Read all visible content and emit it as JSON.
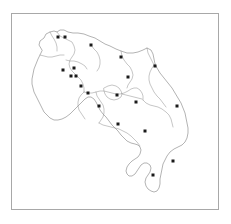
{
  "figure": {
    "type": "point-location-map",
    "title": "",
    "region_name": "Costa Rica",
    "background_color": "#ffffff",
    "frame_color": "#a8a8a8",
    "outline_color": "#808080",
    "border_color": "#8d8d8d",
    "marker_color": "#1a1a1a",
    "marker_count": 20,
    "marker_shape": "square",
    "marker_size_px": 3,
    "legend": null,
    "axis_labels": null,
    "scale_bar": null,
    "north_arrow": null
  },
  "chart_data": {
    "type": "scatter",
    "title": "",
    "xlabel": "",
    "ylabel": "",
    "xlim": [
      11,
      219
    ],
    "ylim": [
      13,
      210
    ],
    "grid": false,
    "legend": null,
    "categories": [],
    "series": [
      {
        "name": "sampling-sites",
        "marker": "square",
        "color": "#1a1a1a",
        "points": [
          {
            "id": "site-01",
            "x": 58,
            "y": 37
          },
          {
            "id": "site-02",
            "x": 65,
            "y": 37
          },
          {
            "id": "site-03",
            "x": 91,
            "y": 45
          },
          {
            "id": "site-04",
            "x": 121,
            "y": 57
          },
          {
            "id": "site-05",
            "x": 155,
            "y": 66
          },
          {
            "id": "site-06",
            "x": 63,
            "y": 70
          },
          {
            "id": "site-07",
            "x": 74,
            "y": 68
          },
          {
            "id": "site-08",
            "x": 71,
            "y": 76
          },
          {
            "id": "site-09",
            "x": 76,
            "y": 76
          },
          {
            "id": "site-10",
            "x": 128,
            "y": 77
          },
          {
            "id": "site-11",
            "x": 81,
            "y": 86
          },
          {
            "id": "site-12",
            "x": 88,
            "y": 93
          },
          {
            "id": "site-13",
            "x": 117,
            "y": 95
          },
          {
            "id": "site-14",
            "x": 136,
            "y": 102
          },
          {
            "id": "site-15",
            "x": 99,
            "y": 106
          },
          {
            "id": "site-16",
            "x": 177,
            "y": 106
          },
          {
            "id": "site-17",
            "x": 118,
            "y": 124
          },
          {
            "id": "site-18",
            "x": 145,
            "y": 131
          },
          {
            "id": "site-19",
            "x": 173,
            "y": 161
          },
          {
            "id": "site-20",
            "x": 153,
            "y": 175
          }
        ]
      }
    ]
  },
  "geometry": {
    "country_outline_path": "M 42 50 L 39 45 L 40 41 L 44 38 L 46 34 L 50 32 L 54 31 L 57 32 L 60 30 L 64 30 L 68 32 L 73 33 L 78 33 L 84 34 L 89 36 L 95 38 L 100 41 L 105 44 L 110 46 L 116 49 L 121 51 L 127 53 L 133 53 L 138 52 L 143 50 L 147 48 L 151 50 L 153 54 L 154 59 L 155 64 L 157 68 L 160 73 L 164 78 L 168 83 L 172 88 L 175 93 L 178 98 L 181 103 L 183 108 L 185 113 L 186 118 L 187 123 L 188 128 L 188 133 L 187 138 L 185 142 L 182 145 L 178 147 L 174 149 L 170 152 L 167 156 L 165 160 L 163 164 L 162 169 L 161 174 L 160 179 L 160 184 L 159 188 L 157 191 L 154 192 L 151 191 L 148 189 L 146 186 L 145 182 L 146 178 L 148 175 L 150 172 L 151 168 L 150 165 L 147 163 L 144 163 L 141 165 L 139 168 L 137 171 L 135 174 L 132 176 L 129 176 L 127 174 L 126 171 L 127 167 L 129 164 L 132 161 L 135 159 L 138 157 L 140 154 L 141 150 L 140 147 L 138 145 L 135 144 L 131 143 L 127 141 L 124 138 L 121 135 L 118 131 L 115 128 L 112 125 L 109 121 L 106 117 L 103 114 L 100 110 L 98 106 L 96 102 L 94 99 L 91 97 L 88 97 L 85 99 L 82 102 L 79 105 L 76 108 L 73 111 L 70 114 L 66 117 L 62 119 L 58 120 L 54 120 L 50 118 L 47 115 L 44 112 L 42 108 L 40 104 L 38 100 L 36 96 L 34 92 L 33 88 L 32 84 L 32 79 L 33 74 L 34 69 L 36 64 L 38 59 L 40 55 Z",
    "province_border_paths": [
      "M 57 32 L 60 36 L 64 38 L 68 40 L 72 42 L 74 46 L 75 50 L 74 54 L 72 57 L 70 60 L 69 64 L 70 68 L 72 71 L 75 74 L 78 77 L 81 80 L 83 84 L 84 88 L 84 92",
      "M 84 92 L 88 93 L 92 93 L 96 92 L 100 91 L 104 91 L 108 92 L 112 93 L 116 94 L 120 94 L 124 93 L 128 91 L 131 89 L 134 88 L 137 88 L 140 90 L 142 93 L 143 96 L 143 100",
      "M 143 100 L 146 103 L 150 105 L 154 106 L 158 107 L 162 109 L 166 112 L 169 115 L 171 119 L 172 123 L 173 127",
      "M 121 51 L 122 56 L 124 60 L 127 64 L 130 67 L 132 71 L 133 75 L 132 79 L 130 82 L 128 85 L 127 88",
      "M 96 92 L 97 96 L 99 99 L 101 102 L 103 105 L 104 109 L 104 113 L 103 117 L 101 120 L 99 123",
      "M 84 92 L 81 95 L 79 98 L 78 102 L 78 106 L 79 110 L 81 113 L 83 116 L 85 119",
      "M 99 123 L 103 125 L 107 126 L 111 127 L 115 128 L 119 129 L 123 131 L 127 133 L 131 136 L 134 139 L 137 142 L 140 146",
      "M 104 88 L 108 86 L 112 85 L 116 86 L 119 88 L 121 91 L 122 94 L 121 97 L 118 99 L 114 100 L 110 99 L 107 97 L 105 94 L 104 91 Z",
      "M 122 94 L 126 95 L 130 96 L 134 97 L 138 98 L 142 99",
      "M 91 45 L 94 49 L 97 52 L 99 56 L 100 60 L 100 64 L 99 68 L 97 71",
      "M 66 60 L 70 61 L 74 61 L 78 62 L 82 64 L 85 66 L 87 69",
      "M 147 48 L 148 53 L 150 57 L 152 61 L 154 65",
      "M 155 64 L 152 68 L 150 72 L 149 76 L 149 80 L 150 84 L 152 88 L 154 92 L 157 96 L 160 99 L 163 103 L 166 107",
      "M 50 32 L 52 36 L 54 39 L 56 43 L 57 47 L 57 51",
      "M 40 55 L 44 56 L 48 57 L 52 57 L 56 56 L 60 55 L 64 55"
    ]
  }
}
